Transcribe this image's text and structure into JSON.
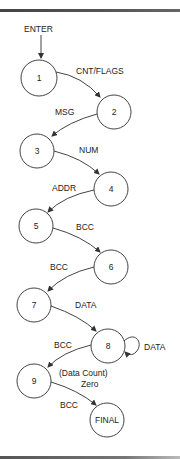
{
  "diagram": {
    "type": "state-transition",
    "entry_label": "ENTER",
    "nodes": [
      {
        "id": "1",
        "label": "1"
      },
      {
        "id": "2",
        "label": "2"
      },
      {
        "id": "3",
        "label": "3"
      },
      {
        "id": "4",
        "label": "4"
      },
      {
        "id": "5",
        "label": "5"
      },
      {
        "id": "6",
        "label": "6"
      },
      {
        "id": "7",
        "label": "7"
      },
      {
        "id": "8",
        "label": "8"
      },
      {
        "id": "9",
        "label": "9"
      },
      {
        "id": "final",
        "label": "FINAL"
      }
    ],
    "edges": [
      {
        "from": "1",
        "to": "2",
        "label": "CNT/FLAGS"
      },
      {
        "from": "2",
        "to": "3",
        "label": "MSG"
      },
      {
        "from": "3",
        "to": "4",
        "label": "NUM"
      },
      {
        "from": "4",
        "to": "5",
        "label": "ADDR"
      },
      {
        "from": "5",
        "to": "6",
        "label": "BCC"
      },
      {
        "from": "6",
        "to": "7",
        "label": "BCC"
      },
      {
        "from": "7",
        "to": "8",
        "label": "DATA"
      },
      {
        "from": "8",
        "to": "8",
        "label": "DATA"
      },
      {
        "from": "8",
        "to": "9",
        "label": "BCC",
        "condition_line1": "(Data Count)",
        "condition_line2": "Zero"
      },
      {
        "from": "9",
        "to": "final",
        "label": "BCC"
      }
    ]
  }
}
